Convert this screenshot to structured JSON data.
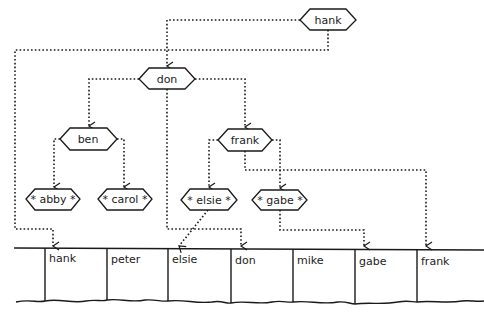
{
  "diagram": {
    "type": "binary-search-tree-with-hash-table",
    "tree": {
      "nodes": [
        {
          "id": "hank",
          "label": "hank",
          "leaf": false
        },
        {
          "id": "don",
          "label": "don",
          "leaf": false
        },
        {
          "id": "ben",
          "label": "ben",
          "leaf": false
        },
        {
          "id": "frank",
          "label": "frank",
          "leaf": false
        },
        {
          "id": "abby",
          "label": "* abby *",
          "leaf": true
        },
        {
          "id": "carol",
          "label": "* carol *",
          "leaf": true
        },
        {
          "id": "elsie",
          "label": "* elsie *",
          "leaf": true
        },
        {
          "id": "gabe",
          "label": "* gabe *",
          "leaf": true
        }
      ],
      "edges": [
        {
          "from": "hank",
          "to": "don"
        },
        {
          "from": "don",
          "to": "ben"
        },
        {
          "from": "don",
          "to": "frank"
        },
        {
          "from": "ben",
          "to": "abby"
        },
        {
          "from": "ben",
          "to": "carol"
        },
        {
          "from": "frank",
          "to": "elsie"
        },
        {
          "from": "frank",
          "to": "gabe"
        }
      ],
      "table_links": [
        {
          "from": "hank",
          "to_cell": "hank"
        },
        {
          "from": "don",
          "to_cell": "don"
        },
        {
          "from": "frank",
          "to_cell": "frank"
        },
        {
          "from": "elsie",
          "to_cell": "elsie"
        },
        {
          "from": "gabe",
          "to_cell": "gabe"
        }
      ]
    },
    "table": {
      "cells": [
        "hank",
        "peter",
        "elsie",
        "don",
        "mike",
        "gabe",
        "frank"
      ]
    }
  }
}
